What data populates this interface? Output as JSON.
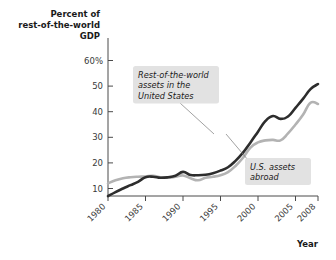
{
  "chart_data": {
    "type": "line",
    "title": "",
    "ylabel": "Percent of rest-of-the-world GDP",
    "xlabel": "Year",
    "ylabel_lines": [
      "Percent of",
      "rest-of-the-world",
      "GDP"
    ],
    "xlim": [
      1980,
      2008
    ],
    "ylim": [
      0,
      62
    ],
    "grid": false,
    "legend_position": "inline-annotations",
    "ytick_labels": [
      "60%",
      "50",
      "40",
      "30",
      "20",
      "10"
    ],
    "ytick_values": [
      60,
      50,
      40,
      30,
      20,
      10
    ],
    "xtick_labels": [
      "1980",
      "1985",
      "1990",
      "1995",
      "2000",
      "2005",
      "2008"
    ],
    "xtick_values": [
      1980,
      1985,
      1990,
      1995,
      2000,
      2005,
      2008
    ],
    "x": [
      1980,
      1981,
      1982,
      1983,
      1984,
      1985,
      1986,
      1987,
      1988,
      1989,
      1990,
      1991,
      1992,
      1993,
      1994,
      1995,
      1996,
      1997,
      1998,
      1999,
      2000,
      2001,
      2002,
      2003,
      2004,
      2005,
      2006,
      2007,
      2008
    ],
    "series": [
      {
        "name": "Rest-of-the-world assets in the United States",
        "color": "#2d2d2d",
        "width": 2.6,
        "values": [
          7.0,
          8.6,
          10.0,
          11.3,
          12.6,
          14.4,
          14.6,
          14.2,
          14.4,
          15.0,
          16.5,
          15.3,
          15.2,
          15.4,
          16.0,
          17.0,
          18.3,
          20.8,
          24.0,
          28.0,
          32.2,
          36.4,
          38.3,
          37.2,
          38.1,
          41.5,
          45.0,
          48.8,
          50.8
        ]
      },
      {
        "name": "U.S. assets abroad",
        "color": "#b3b3b3",
        "width": 2.6,
        "values": [
          12.0,
          13.2,
          14.0,
          14.4,
          14.6,
          14.7,
          15.0,
          14.4,
          14.2,
          14.6,
          15.1,
          14.0,
          13.2,
          14.2,
          14.6,
          15.2,
          16.4,
          18.8,
          22.0,
          26.0,
          28.0,
          28.8,
          29.0,
          28.8,
          31.5,
          35.0,
          38.8,
          43.5,
          43.0
        ]
      }
    ],
    "annotations": [
      {
        "id": "callout-row-assets",
        "lines": [
          "Rest-of-the-world",
          "assets in the",
          "United States"
        ],
        "target_series": "Rest-of-the-world assets in the United States",
        "target_x": 1997,
        "target_y": 20.8
      },
      {
        "id": "callout-us-assets",
        "lines": [
          "U.S. assets",
          "abroad"
        ],
        "target_series": "U.S. assets abroad",
        "target_x": 1999,
        "target_y": 26.0
      }
    ]
  }
}
